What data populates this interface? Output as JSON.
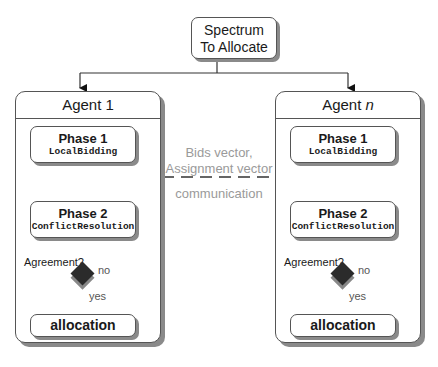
{
  "top_node": {
    "line1": "Spectrum",
    "line2": "To Allocate"
  },
  "agents": [
    {
      "title": "Agent 1",
      "phase1": {
        "title": "Phase 1",
        "subtitle": "LocalBidding"
      },
      "phase2": {
        "title": "Phase 2",
        "subtitle": "ConflictResolution"
      },
      "decision": {
        "question": "Agreement?",
        "no": "no",
        "yes": "yes"
      },
      "result": "allocation"
    },
    {
      "title_prefix": "Agent ",
      "title_var": "n",
      "phase1": {
        "title": "Phase 1",
        "subtitle": "LocalBidding"
      },
      "phase2": {
        "title": "Phase 2",
        "subtitle": "ConflictResolution"
      },
      "decision": {
        "question": "Agreement?",
        "no": "no",
        "yes": "yes"
      },
      "result": "allocation"
    }
  ],
  "communication": {
    "line1": "Bids vector,",
    "line2": "Assignment vector",
    "label": "communication"
  },
  "colors": {
    "stroke": "#555555",
    "shadow": "#8a8a8a",
    "diamond": "#2b2b2b",
    "comm_text": "#9a9a9a"
  }
}
